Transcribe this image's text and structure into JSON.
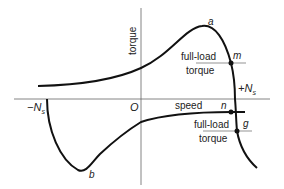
{
  "axes": {
    "y_label": "torque",
    "x_label": "speed",
    "origin": "O",
    "neg_sync": "−N",
    "neg_sync_sub": "s",
    "pos_sync": "+N",
    "pos_sync_sub": "s"
  },
  "points": {
    "a": "a",
    "b": "b",
    "m": "m",
    "n": "n",
    "g": "g"
  },
  "annotations": {
    "upper_full_load": "full-load",
    "upper_torque": "torque",
    "lower_full_load": "full-load",
    "lower_torque": "torque"
  },
  "colors": {
    "curve": "#111111",
    "axis": "#555555"
  }
}
